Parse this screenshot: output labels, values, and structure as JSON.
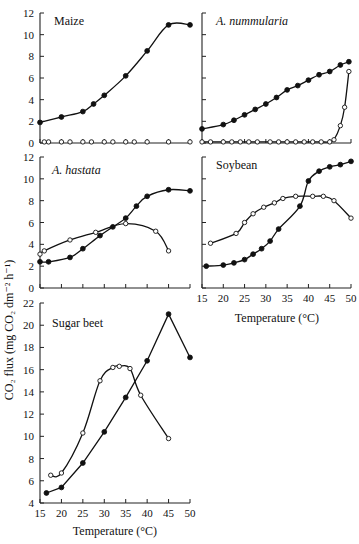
{
  "figure": {
    "y_axis_title": "CO₂ flux (mg CO₂ dm⁻² h⁻¹)",
    "x_axis_title": "Temperature (°C)"
  },
  "chart_data": [
    {
      "type": "line",
      "title": "Maize",
      "title_italic": false,
      "xlabel": "",
      "ylabel": "CO₂ flux (mg CO₂ dm⁻² h⁻¹)",
      "xlim": [
        15,
        50
      ],
      "ylim": [
        0,
        12
      ],
      "yticks": [
        0,
        2,
        4,
        6,
        8,
        10,
        12
      ],
      "xticks": [
        15,
        20,
        25,
        30,
        35,
        40,
        45,
        50
      ],
      "show_xtick_labels": false,
      "series": [
        {
          "name": "filled",
          "marker": "filled-circle",
          "x": [
            15,
            20,
            25,
            27.5,
            30,
            35,
            40,
            45,
            50
          ],
          "y": [
            1.9,
            2.4,
            2.9,
            3.6,
            4.4,
            6.2,
            8.5,
            10.9,
            10.9
          ]
        },
        {
          "name": "open",
          "marker": "open-circle",
          "x": [
            16,
            17,
            20,
            22,
            25,
            27,
            30,
            32,
            35,
            37,
            40,
            45,
            50
          ],
          "y": [
            0.1,
            0.1,
            0.1,
            0.1,
            0.1,
            0.1,
            0.1,
            0.1,
            0.1,
            0.1,
            0.1,
            0.1,
            0.1
          ],
          "no_line": true
        }
      ]
    },
    {
      "type": "line",
      "title": "A. nummularia",
      "title_italic": true,
      "xlim": [
        15,
        50
      ],
      "ylim": [
        0,
        12
      ],
      "yticks": [
        0,
        2,
        4,
        6,
        8,
        10,
        12
      ],
      "xticks": [
        15,
        20,
        25,
        30,
        35,
        40,
        45,
        50
      ],
      "show_ytick_labels": false,
      "show_xtick_labels": false,
      "series": [
        {
          "name": "filled",
          "marker": "filled-circle",
          "x": [
            15,
            20,
            22.5,
            25,
            27.5,
            30,
            32.5,
            35,
            37.5,
            40,
            42.5,
            45,
            47.5,
            49.5
          ],
          "y": [
            1.3,
            1.7,
            2.1,
            2.6,
            3.1,
            3.6,
            4.2,
            4.9,
            5.3,
            5.8,
            6.3,
            6.6,
            7.2,
            7.5
          ]
        },
        {
          "name": "open",
          "marker": "open-circle",
          "x": [
            15,
            17,
            20,
            22,
            24,
            26,
            28,
            31,
            33,
            35,
            37,
            39,
            41,
            43,
            45,
            46,
            47.5,
            48.5,
            49.5
          ],
          "y": [
            0.1,
            0.1,
            0.1,
            0.1,
            0.1,
            0.1,
            0.1,
            0.1,
            0.1,
            0.1,
            0.1,
            0.1,
            0.1,
            0.1,
            0.1,
            0.3,
            1.6,
            3.3,
            6.6
          ]
        }
      ]
    },
    {
      "type": "line",
      "title": "A. hastata",
      "title_italic": true,
      "xlim": [
        15,
        50
      ],
      "ylim": [
        0,
        12
      ],
      "yticks": [
        0,
        2,
        4,
        6,
        8,
        10,
        12
      ],
      "xticks": [
        15,
        20,
        25,
        30,
        35,
        40,
        45,
        50
      ],
      "show_xtick_labels": false,
      "series": [
        {
          "name": "filled",
          "marker": "filled-circle",
          "x": [
            15,
            17,
            22,
            25,
            29,
            32,
            35,
            37.5,
            40,
            45,
            50
          ],
          "y": [
            2.4,
            2.4,
            2.8,
            3.6,
            4.8,
            5.6,
            6.4,
            7.5,
            8.4,
            9.0,
            8.9
          ]
        },
        {
          "name": "open",
          "marker": "open-circle",
          "x": [
            15,
            16,
            22,
            28,
            35,
            42,
            45
          ],
          "y": [
            3.1,
            3.4,
            4.4,
            5.1,
            5.9,
            5.2,
            3.4
          ]
        }
      ]
    },
    {
      "type": "line",
      "title": "Soybean",
      "title_italic": false,
      "xlabel": "Temperature (°C)",
      "xlim": [
        15,
        50
      ],
      "ylim": [
        0,
        12
      ],
      "yticks": [
        0,
        2,
        4,
        6,
        8,
        10,
        12
      ],
      "xticks": [
        15,
        20,
        25,
        30,
        35,
        40,
        45,
        50
      ],
      "show_ytick_labels": false,
      "series": [
        {
          "name": "filled",
          "marker": "filled-circle",
          "x": [
            16,
            20,
            22.5,
            25,
            27,
            29,
            31,
            33,
            38,
            40,
            42.5,
            45,
            47.5,
            50
          ],
          "y": [
            2.0,
            2.1,
            2.3,
            2.6,
            3.1,
            3.6,
            4.3,
            5.4,
            7.5,
            9.8,
            10.7,
            11.1,
            11.3,
            11.6
          ]
        },
        {
          "name": "open",
          "marker": "open-circle",
          "x": [
            17,
            23,
            25,
            27,
            29.5,
            32,
            34,
            37,
            41,
            43.5,
            46,
            50
          ],
          "y": [
            4.1,
            5.0,
            6.0,
            6.8,
            7.4,
            7.8,
            8.2,
            8.4,
            8.4,
            8.4,
            8.0,
            6.4
          ]
        }
      ]
    },
    {
      "type": "line",
      "title": "Sugar beet",
      "title_italic": false,
      "xlabel": "Temperature (°C)",
      "xlim": [
        15,
        50
      ],
      "ylim": [
        4,
        22
      ],
      "yticks": [
        4,
        6,
        8,
        10,
        12,
        14,
        16,
        18,
        20,
        22
      ],
      "xticks": [
        15,
        20,
        25,
        30,
        35,
        40,
        45,
        50
      ],
      "series": [
        {
          "name": "filled",
          "marker": "filled-circle",
          "x": [
            16.5,
            20,
            25,
            30,
            35,
            40,
            45,
            50
          ],
          "y": [
            4.9,
            5.4,
            7.6,
            10.4,
            13.5,
            16.8,
            21.0,
            17.1
          ],
          "straight": true
        },
        {
          "name": "open",
          "marker": "open-circle",
          "x": [
            17.5,
            20,
            25,
            29,
            32,
            33.5,
            36,
            38.5,
            45
          ],
          "y": [
            6.5,
            6.7,
            10.3,
            15.0,
            16.2,
            16.3,
            16.1,
            13.7,
            9.8
          ]
        }
      ]
    }
  ]
}
